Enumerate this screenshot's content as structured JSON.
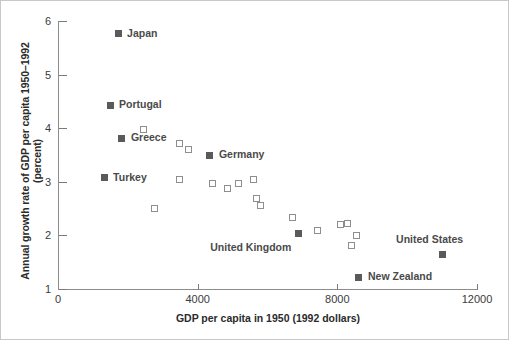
{
  "figure": {
    "width": 509,
    "height": 340,
    "background": "#ffffff",
    "border_color": "#c8c8c8"
  },
  "colors": {
    "filled_marker": "#5a5a5a",
    "open_marker": "#8e8e8e",
    "axis": "#8c8c8c",
    "label_text": "#4a4a4a",
    "title_text": "#2b2b2b"
  },
  "chart_data": {
    "type": "scatter",
    "title": "",
    "xlabel": "GDP per capita in 1950 (1992 dollars)",
    "ylabel": "Annual growth rate of GDP per capita 1950–1992 (percent)",
    "xlim": [
      0,
      12000
    ],
    "ylim": [
      1,
      6
    ],
    "xticks": [
      0,
      4000,
      8000,
      12000
    ],
    "xtick_labels": [
      "0",
      "4000",
      "8000",
      "12000"
    ],
    "yticks": [
      1,
      2,
      3,
      4,
      5,
      6
    ],
    "ytick_labels": [
      "1",
      "2",
      "3",
      "4",
      "5",
      "6"
    ],
    "grid": false,
    "legend": "none",
    "series": [
      {
        "name": "Labeled countries",
        "marker": "filled-square",
        "points": [
          {
            "label": "Japan",
            "x": 1720,
            "y": 5.76,
            "label_dx": 9,
            "label_dy": -6
          },
          {
            "label": "Portugal",
            "x": 1490,
            "y": 4.43,
            "label_dx": 9,
            "label_dy": -6
          },
          {
            "label": "Greece",
            "x": 1830,
            "y": 3.81,
            "label_dx": 9,
            "label_dy": -6
          },
          {
            "label": "Turkey",
            "x": 1320,
            "y": 3.08,
            "label_dx": 9,
            "label_dy": -6
          },
          {
            "label": "Germany",
            "x": 4350,
            "y": 3.5,
            "label_dx": 9,
            "label_dy": -6
          },
          {
            "label": "United Kingdom",
            "x": 6880,
            "y": 2.03,
            "label_dx": -88,
            "label_dy": 8
          },
          {
            "label": "New Zealand",
            "x": 8620,
            "y": 1.22,
            "label_dx": 9,
            "label_dy": -6
          },
          {
            "label": "United States",
            "x": 11000,
            "y": 1.65,
            "label_dx": -46,
            "label_dy": -20
          }
        ]
      },
      {
        "name": "Other OECD countries",
        "marker": "open-square",
        "points": [
          {
            "x": 2460,
            "y": 3.97
          },
          {
            "x": 3470,
            "y": 3.72
          },
          {
            "x": 3750,
            "y": 3.6
          },
          {
            "x": 2760,
            "y": 2.51
          },
          {
            "x": 3490,
            "y": 3.04
          },
          {
            "x": 4430,
            "y": 2.97
          },
          {
            "x": 4860,
            "y": 2.88
          },
          {
            "x": 5170,
            "y": 2.97
          },
          {
            "x": 5600,
            "y": 3.04
          },
          {
            "x": 5680,
            "y": 2.68
          },
          {
            "x": 5810,
            "y": 2.55
          },
          {
            "x": 6730,
            "y": 2.33
          },
          {
            "x": 7430,
            "y": 2.09
          },
          {
            "x": 8100,
            "y": 2.21
          },
          {
            "x": 8290,
            "y": 2.22
          },
          {
            "x": 8560,
            "y": 1.99
          },
          {
            "x": 8400,
            "y": 1.81
          }
        ]
      }
    ]
  }
}
